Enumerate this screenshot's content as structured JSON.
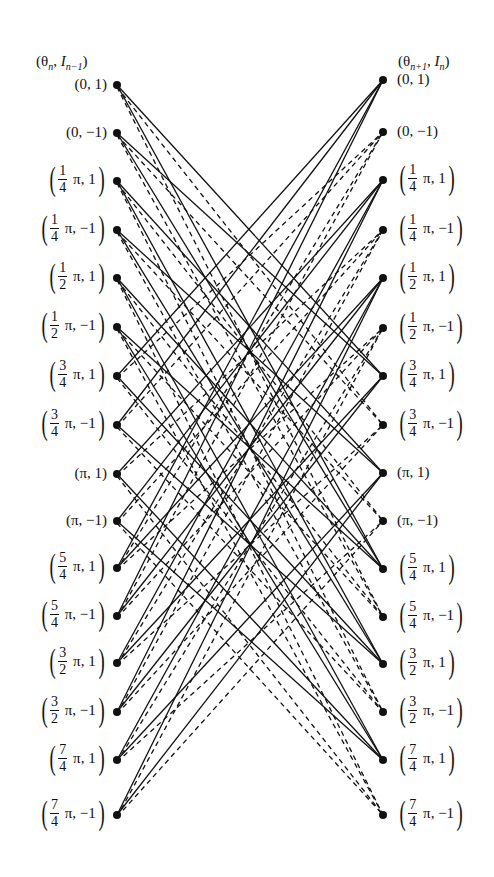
{
  "header": {
    "left": {
      "theta": "θ",
      "theta_sub": "n",
      "I": "I",
      "I_sub": "n−1"
    },
    "right": {
      "theta": "θ",
      "theta_sub": "n+1",
      "I": "I",
      "I_sub": "n"
    }
  },
  "states": [
    {
      "phase": "0",
      "frac": null,
      "sym": "1"
    },
    {
      "phase": "0",
      "frac": null,
      "sym": "−1"
    },
    {
      "phase": "π",
      "frac": [
        "1",
        "4"
      ],
      "sym": "1"
    },
    {
      "phase": "π",
      "frac": [
        "1",
        "4"
      ],
      "sym": "−1"
    },
    {
      "phase": "π",
      "frac": [
        "1",
        "2"
      ],
      "sym": "1"
    },
    {
      "phase": "π",
      "frac": [
        "1",
        "2"
      ],
      "sym": "−1"
    },
    {
      "phase": "π",
      "frac": [
        "3",
        "4"
      ],
      "sym": "1"
    },
    {
      "phase": "π",
      "frac": [
        "3",
        "4"
      ],
      "sym": "−1"
    },
    {
      "phase": "π",
      "frac": null,
      "sym": "1"
    },
    {
      "phase": "π",
      "frac": null,
      "sym": "−1"
    },
    {
      "phase": "π",
      "frac": [
        "5",
        "4"
      ],
      "sym": "1"
    },
    {
      "phase": "π",
      "frac": [
        "5",
        "4"
      ],
      "sym": "−1"
    },
    {
      "phase": "π",
      "frac": [
        "3",
        "2"
      ],
      "sym": "1"
    },
    {
      "phase": "π",
      "frac": [
        "3",
        "2"
      ],
      "sym": "−1"
    },
    {
      "phase": "π",
      "frac": [
        "7",
        "4"
      ],
      "sym": "1"
    },
    {
      "phase": "π",
      "frac": [
        "7",
        "4"
      ],
      "sym": "−1"
    }
  ],
  "left_y": [
    85,
    133,
    181,
    230,
    278,
    327,
    376,
    425,
    474,
    521,
    568,
    616,
    663,
    712,
    760,
    815
  ],
  "right_y": [
    80,
    132,
    180,
    230,
    278,
    328,
    376,
    425,
    473,
    521,
    569,
    617,
    664,
    712,
    760,
    815
  ],
  "left_x": 117,
  "right_x": 383,
  "line_color": "#111111"
}
